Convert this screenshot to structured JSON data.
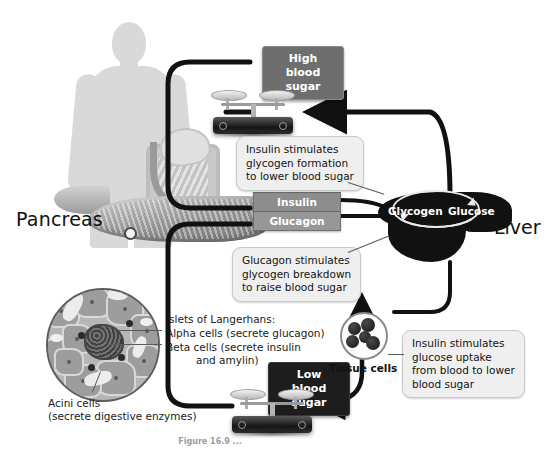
{
  "figure": {
    "caption": "Figure 16.9  ..."
  },
  "organism": {
    "pancreas_label": "Pancreas",
    "liver_label": "Liver",
    "tissue_label": "Tissue cells"
  },
  "plaques": {
    "high": "High blood\nsugar",
    "low": "Low blood\nsugar"
  },
  "hormones": {
    "insulin": "Insulin",
    "glucagon": "Glucagon"
  },
  "liver_cycle": {
    "glycogen": "Glycogen",
    "glucose": "Glucose"
  },
  "callouts": [
    {
      "id": "insulin-glycogen",
      "text": "Insulin stimulates\nglycogen formation\nto lower blood sugar"
    },
    {
      "id": "glucagon-breakdown",
      "text": "Glucagon stimulates\nglycogen breakdown\nto raise blood sugar"
    },
    {
      "id": "insulin-uptake",
      "text": "Insulin stimulates\nglucose uptake\nfrom blood to lower\nblood sugar"
    }
  ],
  "islet_labels": {
    "heading": "Islets of Langerhans:",
    "alpha": "Alpha cells (secrete glucagon)",
    "beta_line1": "Beta cells (secrete insulin",
    "beta_line2": "and amylin)",
    "acini_line1": "Acini cells",
    "acini_line2": "(secrete digestive enzymes)"
  },
  "colors": {
    "background": "#ffffff",
    "silhouette": "#d9d9d9",
    "pipe": "#111111",
    "plaque_high": "#6e6e6e",
    "plaque_low": "#1d1d1d",
    "hormone_bar": "#8a8a8a",
    "liver": "#111111",
    "callout_bg": "#efefef"
  }
}
